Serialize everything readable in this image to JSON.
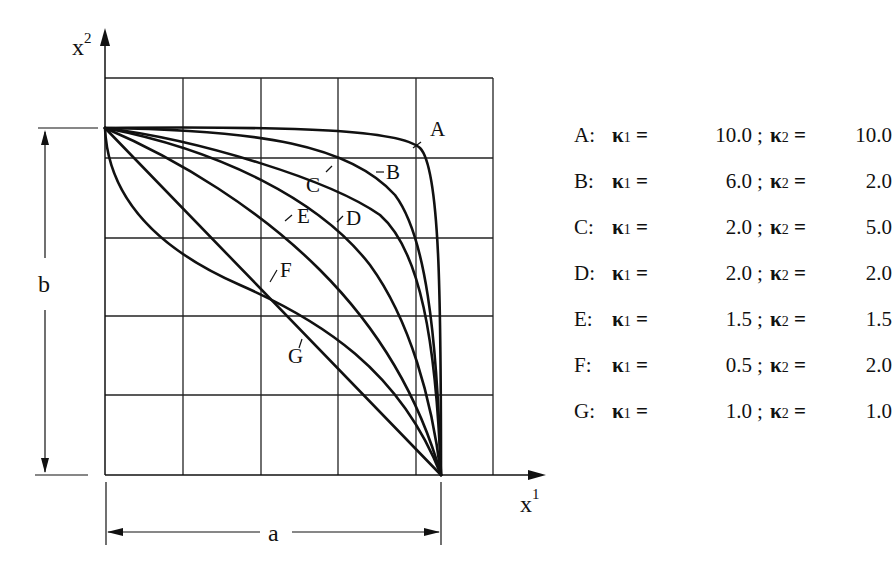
{
  "figure": {
    "axes": {
      "x_label": "x",
      "x_superscript": "1",
      "y_label": "x",
      "y_superscript": "2"
    },
    "dimensions": {
      "width_label": "a",
      "height_label": "b"
    },
    "curve_labels": [
      "A",
      "B",
      "C",
      "D",
      "E",
      "F",
      "G"
    ]
  },
  "legend": {
    "items": [
      {
        "key": "A",
        "k1": "10.0",
        "k2": "10.0"
      },
      {
        "key": "B",
        "k1": "6.0",
        "k2": "2.0"
      },
      {
        "key": "C",
        "k1": "2.0",
        "k2": "5.0"
      },
      {
        "key": "D",
        "k1": "2.0",
        "k2": "2.0"
      },
      {
        "key": "E",
        "k1": "1.5",
        "k2": "1.5"
      },
      {
        "key": "F",
        "k1": "0.5",
        "k2": "2.0"
      },
      {
        "key": "G",
        "k1": "1.0",
        "k2": "1.0"
      }
    ],
    "kappa_symbol": "κ",
    "sub1": "1",
    "sub2": "2",
    "equals": "=",
    "separator": ";",
    "colon": ":"
  },
  "chart_data": {
    "type": "line",
    "title": "",
    "xlabel": "x^1",
    "ylabel": "x^2",
    "grid": true,
    "domain": {
      "x": [
        0,
        "a"
      ],
      "y": [
        0,
        "b"
      ]
    },
    "series": [
      {
        "name": "A",
        "kappa1": 10.0,
        "kappa2": 10.0
      },
      {
        "name": "B",
        "kappa1": 6.0,
        "kappa2": 2.0
      },
      {
        "name": "C",
        "kappa1": 2.0,
        "kappa2": 5.0
      },
      {
        "name": "D",
        "kappa1": 2.0,
        "kappa2": 2.0
      },
      {
        "name": "E",
        "kappa1": 1.5,
        "kappa2": 1.5
      },
      {
        "name": "F",
        "kappa1": 0.5,
        "kappa2": 2.0
      },
      {
        "name": "G",
        "kappa1": 1.0,
        "kappa2": 1.0
      }
    ],
    "legend_position": "right"
  }
}
